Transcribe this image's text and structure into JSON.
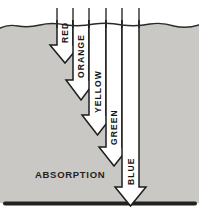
{
  "diagram": {
    "caption": "ABSORPTION",
    "arrows": [
      {
        "label": "RED"
      },
      {
        "label": "ORANGE"
      },
      {
        "label": "YELLOW"
      },
      {
        "label": "GREEN"
      },
      {
        "label": "BLUE"
      }
    ],
    "colors": {
      "water": "#c9c8c4",
      "ink": "#1d1d1b",
      "arrow_fill": "#ffffff",
      "background": "#ffffff"
    }
  }
}
